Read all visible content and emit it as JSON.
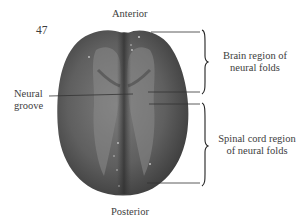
{
  "figure": {
    "number": "47"
  },
  "labels": {
    "anterior": "Anterior",
    "posterior": "Posterior",
    "neural_groove": [
      "Neural",
      "groove"
    ],
    "brain_region": [
      "Brain region of",
      "neural folds"
    ],
    "spinal_region": [
      "Spinal cord region",
      "of neural folds"
    ]
  },
  "colors": {
    "background": "#ffffff",
    "embryo_dark": "#3f3f3f",
    "embryo_mid": "#6e6e6e",
    "embryo_light": "#8c8c8c",
    "line": "#333333",
    "text": "#3d3d3d"
  }
}
